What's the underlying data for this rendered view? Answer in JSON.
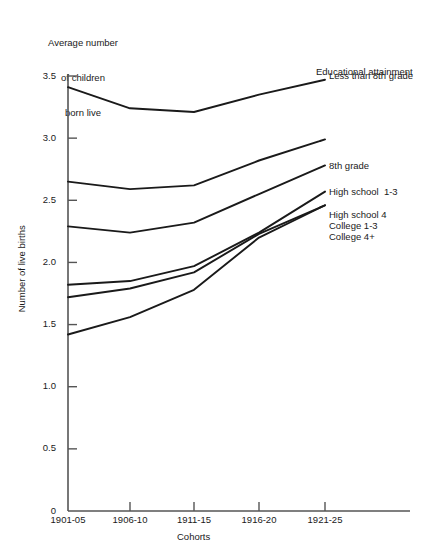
{
  "chart_data": {
    "type": "line",
    "title": "",
    "caption_lines": [
      "Average number",
      "of children",
      "born live"
    ],
    "xlabel": "Cohorts",
    "ylabel": "Number of live births",
    "legend_title": "Educational attainment",
    "legend_position": "right-inline",
    "grid": false,
    "categories": [
      "1901-05",
      "1906-10",
      "1911-15",
      "1916-20",
      "1921-25"
    ],
    "ylim": [
      0,
      3.5
    ],
    "yticks": [
      0,
      0.5,
      1.0,
      1.5,
      2.0,
      2.5,
      3.0,
      3.5
    ],
    "ytick_labels": [
      "0",
      "0.5",
      "1.0",
      "1.5",
      "2.0",
      "2.5",
      "3.0",
      "3.5"
    ],
    "series": [
      {
        "name": "Less than 8th grade",
        "values": [
          3.41,
          3.24,
          3.21,
          3.35,
          3.47
        ]
      },
      {
        "name": "8th grade",
        "values": [
          2.65,
          2.59,
          2.62,
          2.82,
          2.99
        ]
      },
      {
        "name": "High school  1-3",
        "values": [
          2.29,
          2.24,
          2.32,
          2.55,
          2.78
        ]
      },
      {
        "name": "High school 4",
        "values": [
          1.82,
          1.85,
          1.97,
          2.24,
          2.57
        ]
      },
      {
        "name": "College 1-3",
        "values": [
          1.72,
          1.79,
          1.92,
          2.23,
          2.46
        ]
      },
      {
        "name": "College 4+",
        "values": [
          1.42,
          1.56,
          1.78,
          2.2,
          2.46
        ]
      }
    ],
    "line_color": "#1a1a1a",
    "axis_color": "#555555"
  },
  "legend_label_tops": [
    70,
    160,
    186,
    209,
    220,
    231
  ]
}
